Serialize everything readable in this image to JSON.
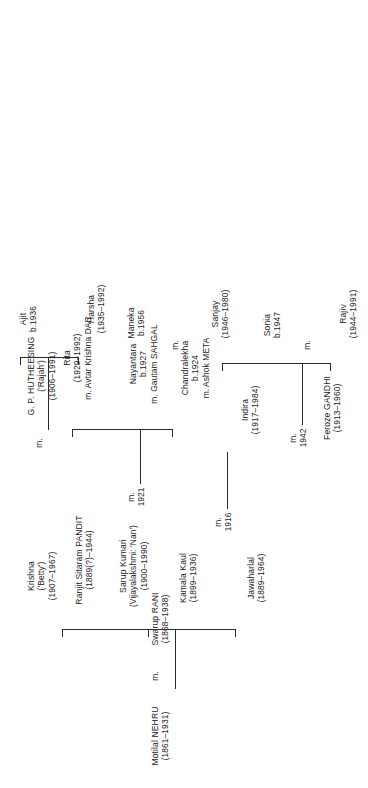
{
  "document": {
    "type": "genealogical-family-tree",
    "title": "Nehru-Gandhi family tree",
    "orientation": "rotated-90-ccw",
    "background_color": "#ffffff",
    "line_color": "#2b2b2b",
    "text_color": "#1a1a1a"
  },
  "generations": {
    "g1": {
      "label": "Generation 1",
      "people": [
        {
          "id": "motilal",
          "name": "Motilal NEHRU",
          "dates": "(1861–1931)"
        },
        {
          "id": "swarup",
          "name": "Swarup RANI",
          "dates": "(1868–1938)"
        }
      ],
      "marriage": {
        "mark": "m.",
        "year": ""
      }
    },
    "g2": {
      "label": "Generation 2",
      "people": [
        {
          "id": "jawaharlal",
          "name": "Jawaharlal",
          "dates": "(1889–1964)"
        },
        {
          "id": "kamala",
          "name": "Kamala Kaul",
          "dates": "(1899–1936)"
        },
        {
          "id": "sarup",
          "name": "Sarup Kumari",
          "alias": "(Vijayalakshmi: 'Nan')",
          "dates": "(1900–1990)"
        },
        {
          "id": "ranjit",
          "name": "Ranjit Sitaram PANDIT",
          "dates": "(1889(?)–1944)"
        },
        {
          "id": "krishna",
          "name": "Krishna",
          "alias": "('Betty')",
          "dates": "(1907–1967)"
        },
        {
          "id": "huthessing",
          "name": "G. P. HUTHEESING",
          "alias": "('Rajah')",
          "dates": "(1906–1991)"
        }
      ],
      "marriages": [
        {
          "id": "m-jawaharlal-kamala",
          "mark": "m.",
          "year": "1916"
        },
        {
          "id": "m-sarup-ranjit",
          "mark": "m.",
          "year": "1921"
        },
        {
          "id": "m-krishna-huthessing",
          "mark": "m.",
          "year": ""
        }
      ]
    },
    "g3": {
      "label": "Generation 3",
      "people": [
        {
          "id": "indira",
          "name": "Indira",
          "dates": "(1917–1984)"
        },
        {
          "id": "feroze",
          "name": "Feroze GANDHI",
          "dates": "(1913–1960)"
        },
        {
          "id": "chandralekha",
          "name": "Chandralekha",
          "dates": "b.1924",
          "spouse": "m. Ashok META"
        },
        {
          "id": "nayantara",
          "name": "Nayantara",
          "dates": "b.1927",
          "spouse": "m. Gautam SAHGAL"
        },
        {
          "id": "rita",
          "name": "Rita",
          "dates": "(1929–1992)",
          "spouse": "m. Avtar Krishna DAR"
        },
        {
          "id": "harsha",
          "name": "Harsha",
          "dates": "(1935–1992)"
        },
        {
          "id": "ajit",
          "name": "Ajit",
          "dates": "b.1936"
        }
      ],
      "marriages": [
        {
          "id": "m-indira-feroze",
          "mark": "m.",
          "year": "1942"
        }
      ]
    },
    "g4": {
      "label": "Generation 4",
      "people": [
        {
          "id": "rajiv",
          "name": "Rajiv",
          "dates": "(1944–1991)"
        },
        {
          "id": "sonia",
          "name": "Sonia",
          "dates": "b.1947"
        },
        {
          "id": "sanjay",
          "name": "Sanjay",
          "dates": "(1946–1980)"
        },
        {
          "id": "maneka",
          "name": "Maneka",
          "dates": "b.1956"
        }
      ],
      "marriages": [
        {
          "id": "m-rajiv-sonia",
          "mark": "m.",
          "year": ""
        },
        {
          "id": "m-sanjay-maneka",
          "mark": "m.",
          "year": ""
        }
      ]
    }
  }
}
